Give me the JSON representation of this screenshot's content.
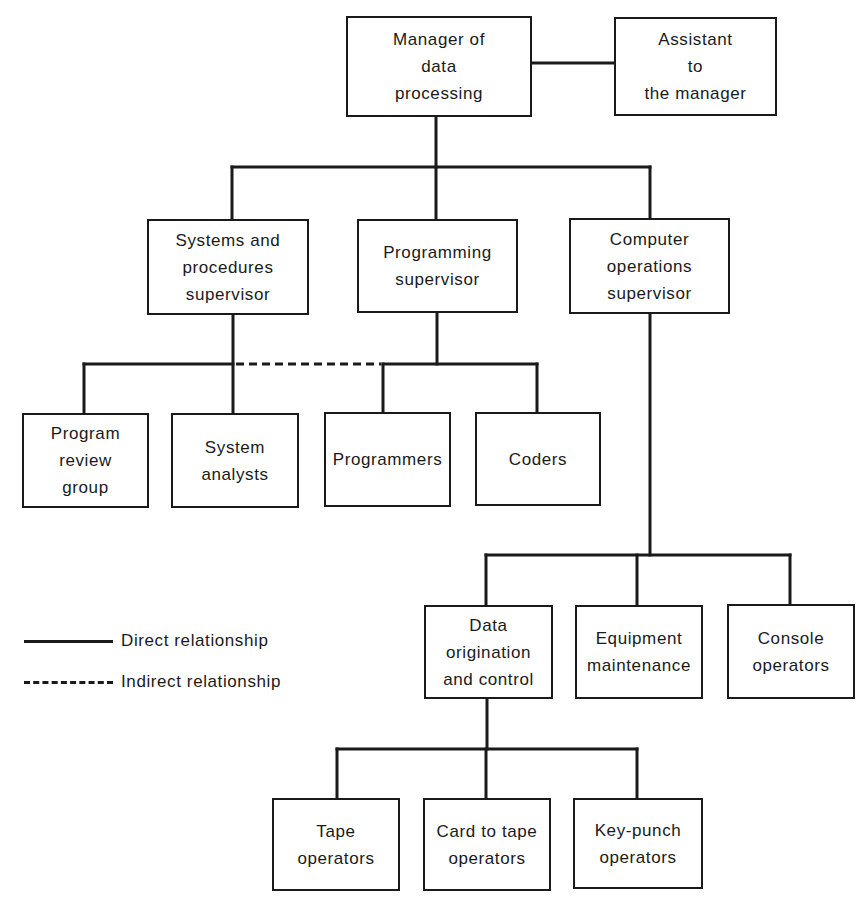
{
  "diagram": {
    "type": "organization-chart",
    "nodes": {
      "manager": {
        "label": "Manager of\ndata\nprocessing"
      },
      "assistant": {
        "label": "Assistant\nto\nthe manager"
      },
      "systems_supervisor": {
        "label": "Systems and\nprocedures\nsupervisor"
      },
      "programming_supervisor": {
        "label": "Programming\nsupervisor"
      },
      "computer_ops_supervisor": {
        "label": "Computer\noperations\nsupervisor"
      },
      "program_review_group": {
        "label": "Program\nreview\ngroup"
      },
      "system_analysts": {
        "label": "System\nanalysts"
      },
      "programmers": {
        "label": "Programmers"
      },
      "coders": {
        "label": "Coders"
      },
      "data_origination": {
        "label": "Data\norigination\nand control"
      },
      "equipment_maintenance": {
        "label": "Equipment\nmaintenance"
      },
      "console_operators": {
        "label": "Console\noperators"
      },
      "tape_operators": {
        "label": "Tape\noperators"
      },
      "card_to_tape_operators": {
        "label": "Card to tape\noperators"
      },
      "keypunch_operators": {
        "label": "Key-punch\noperators"
      }
    },
    "relationships": [
      {
        "from": "Manager of data processing",
        "to": "Assistant to the manager",
        "type": "direct"
      },
      {
        "from": "Manager of data processing",
        "to": "Systems and procedures supervisor",
        "type": "direct"
      },
      {
        "from": "Manager of data processing",
        "to": "Programming supervisor",
        "type": "direct"
      },
      {
        "from": "Manager of data processing",
        "to": "Computer operations supervisor",
        "type": "direct"
      },
      {
        "from": "Systems and procedures supervisor",
        "to": "Program review group",
        "type": "direct"
      },
      {
        "from": "Systems and procedures supervisor",
        "to": "System analysts",
        "type": "direct"
      },
      {
        "from": "Systems and procedures supervisor",
        "to": "Programmers",
        "type": "indirect"
      },
      {
        "from": "Programming supervisor",
        "to": "Programmers",
        "type": "direct"
      },
      {
        "from": "Programming supervisor",
        "to": "Coders",
        "type": "direct"
      },
      {
        "from": "Computer operations supervisor",
        "to": "Data origination and control",
        "type": "direct"
      },
      {
        "from": "Computer operations supervisor",
        "to": "Equipment maintenance",
        "type": "direct"
      },
      {
        "from": "Computer operations supervisor",
        "to": "Console operators",
        "type": "direct"
      },
      {
        "from": "Data origination and control",
        "to": "Tape operators",
        "type": "direct"
      },
      {
        "from": "Data origination and control",
        "to": "Card to tape operators",
        "type": "direct"
      },
      {
        "from": "Data origination and control",
        "to": "Key-punch operators",
        "type": "direct"
      }
    ]
  },
  "legend": {
    "direct": "Direct relationship",
    "indirect": "Indirect relationship"
  },
  "colors": {
    "ink": "#1a1a1a",
    "background": "#ffffff"
  }
}
